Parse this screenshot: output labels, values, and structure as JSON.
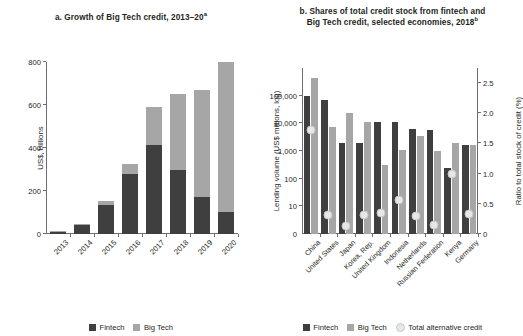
{
  "figure": {
    "background": "#ffffff",
    "colors": {
      "fintech": "#3f3f3f",
      "bigtech": "#a6a6a6",
      "total_alt_credit": "#e6e7e8",
      "axis": "#6d6e71",
      "text": "#231f20"
    }
  },
  "panel_a": {
    "title": "a. Growth of Big Tech credit, 2013–20",
    "title_superscript": "a",
    "legend": [
      {
        "label": "Fintech",
        "key": "fintech"
      },
      {
        "label": "Big Tech",
        "key": "bigtech"
      }
    ]
  },
  "panel_b": {
    "title_line1": "b. Shares of total credit stock from fintech and",
    "title_line2": "Big Tech credit, selected economies, 2018",
    "title_superscript": "b",
    "legend": [
      {
        "label": "Fintech",
        "key": "fintech"
      },
      {
        "label": "Big Tech",
        "key": "bigtech"
      },
      {
        "label": "Total alternative credit",
        "key": "total_alt_credit"
      }
    ]
  },
  "chart_data": [
    {
      "id": "panel-a",
      "type": "bar",
      "stacked": true,
      "title": "a. Growth of Big Tech credit, 2013–20a",
      "xlabel": "",
      "ylabel": "US$, billions",
      "ylim": [
        0,
        800
      ],
      "yticks": [
        0,
        200,
        400,
        600,
        800
      ],
      "ytick_labels": [
        "0",
        "200",
        "400",
        "600",
        "800"
      ],
      "grid": false,
      "legend_position": "bottom",
      "categories": [
        "2013",
        "2014",
        "2015",
        "2016",
        "2017",
        "2018",
        "2019",
        "2020"
      ],
      "series": [
        {
          "name": "Fintech",
          "color": "#3f3f3f",
          "values": [
            11,
            40,
            135,
            280,
            412,
            300,
            172,
            105
          ]
        },
        {
          "name": "Big Tech",
          "color": "#a6a6a6",
          "values": [
            4,
            6,
            19,
            45,
            180,
            352,
            500,
            700
          ]
        }
      ],
      "totals": [
        15,
        46,
        154,
        325,
        592,
        652,
        672,
        805
      ]
    },
    {
      "id": "panel-b",
      "type": "bar",
      "stacked": false,
      "title": "b. Shares of total credit stock from fintech and Big Tech credit, selected economies, 2018b",
      "xlabel": "",
      "ylabel": "Lending volume (US$ millions, log)",
      "ylabel_secondary": "Ratio to total stock of credit (%)",
      "y_scale": "log",
      "ylim": [
        1,
        1000000
      ],
      "yticks": [
        10,
        100,
        1000,
        10000,
        100000
      ],
      "ytick_labels": [
        "10",
        "100",
        "1,000",
        "10,000",
        "100,000"
      ],
      "ytick_zero_label": "0",
      "ylim_secondary": [
        0,
        2.75
      ],
      "yticks_secondary": [
        0,
        0.5,
        1.0,
        1.5,
        2.0,
        2.5
      ],
      "ytick_labels_secondary": [
        "0",
        "0.5",
        "1.0",
        "1.5",
        "2.0",
        "2.5"
      ],
      "grid": false,
      "legend_position": "bottom",
      "categories": [
        "China",
        "United States",
        "Japan",
        "Korea, Rep.",
        "United Kingdom",
        "Indonesia",
        "Netherlands",
        "Russian Federation",
        "Kenya",
        "Germany"
      ],
      "series": [
        {
          "name": "Fintech",
          "color": "#3f3f3f",
          "axis": "left",
          "values": [
            100000,
            70000,
            2000,
            2000,
            11000,
            11000,
            6200,
            5800,
            250,
            1700
          ]
        },
        {
          "name": "Big Tech",
          "color": "#a6a6a6",
          "axis": "left",
          "values": [
            420000,
            7500,
            23000,
            11000,
            300,
            1100,
            3500,
            1000,
            2000,
            1700
          ]
        },
        {
          "name": "Total alternative credit",
          "color": "#e6e7e8",
          "axis": "right",
          "marker": "circle",
          "values": [
            1.72,
            0.31,
            0.14,
            0.32,
            0.35,
            0.56,
            0.3,
            0.15,
            1.0,
            0.33
          ]
        }
      ]
    }
  ]
}
